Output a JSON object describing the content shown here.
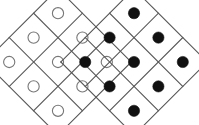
{
  "figure": {
    "canvas": {
      "width": 199,
      "height": 125,
      "background": "#ffffff"
    },
    "style": {
      "grid_line_color": "#555555",
      "grid_line_width": 1.1,
      "open_circle_stroke": "#777777",
      "open_circle_fill": "#ffffff",
      "open_circle_stroke_width": 1.1,
      "filled_circle_fill": "#111111",
      "filled_circle_stroke": "#111111",
      "circle_radius": 5.6
    },
    "groups": [
      {
        "id": "left-diamond",
        "label": "Left diamond grid of open circles",
        "marker_style": "open",
        "rows": 3,
        "cols": 3,
        "rotation_deg": 45,
        "cell_size": 34.5,
        "center_x": 58,
        "center_y": 62,
        "circle_count": 9,
        "cells": [
          {
            "row": 0,
            "col": 0,
            "marker": "open"
          },
          {
            "row": 0,
            "col": 1,
            "marker": "open"
          },
          {
            "row": 0,
            "col": 2,
            "marker": "open"
          },
          {
            "row": 1,
            "col": 0,
            "marker": "open"
          },
          {
            "row": 1,
            "col": 1,
            "marker": "open"
          },
          {
            "row": 1,
            "col": 2,
            "marker": "open"
          },
          {
            "row": 2,
            "col": 0,
            "marker": "open"
          },
          {
            "row": 2,
            "col": 1,
            "marker": "open"
          },
          {
            "row": 2,
            "col": 2,
            "marker": "open"
          }
        ]
      },
      {
        "id": "right-diamond",
        "label": "Right diamond grid of filled circles",
        "marker_style": "filled",
        "rows": 3,
        "cols": 3,
        "rotation_deg": 45,
        "cell_size": 34.5,
        "center_x": 134,
        "center_y": 62,
        "circle_count": 9,
        "cells": [
          {
            "row": 0,
            "col": 0,
            "marker": "filled"
          },
          {
            "row": 0,
            "col": 1,
            "marker": "filled"
          },
          {
            "row": 0,
            "col": 2,
            "marker": "filled"
          },
          {
            "row": 1,
            "col": 0,
            "marker": "filled"
          },
          {
            "row": 1,
            "col": 1,
            "marker": "filled"
          },
          {
            "row": 1,
            "col": 2,
            "marker": "filled"
          },
          {
            "row": 2,
            "col": 0,
            "marker": "filled"
          },
          {
            "row": 2,
            "col": 1,
            "marker": "filled"
          },
          {
            "row": 2,
            "col": 2,
            "marker": "filled"
          }
        ]
      }
    ]
  }
}
